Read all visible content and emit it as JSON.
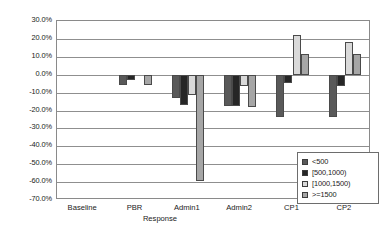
{
  "chart_data": {
    "type": "bar",
    "title": "",
    "xlabel": "Response",
    "ylabel": "",
    "ylim": [
      -70,
      30
    ],
    "grid": true,
    "legend_position": "inside-lower-right",
    "ytick_labels": [
      "30.0%",
      "20.0%",
      "10.0%",
      "0.0%",
      "-10.0%",
      "-20.0%",
      "-30.0%",
      "-40.0%",
      "-50.0%",
      "-60.0%",
      "-70.0%"
    ],
    "ytick_values": [
      30,
      20,
      10,
      0,
      -10,
      -20,
      -30,
      -40,
      -50,
      -60,
      -70
    ],
    "categories": [
      "Baseline",
      "PBR",
      "Admin1",
      "Admin2",
      "CP1",
      "CP2"
    ],
    "series": [
      {
        "name": "<500",
        "color": "#595959",
        "values": [
          0.0,
          -6.0,
          -13.0,
          -17.5,
          -23.5,
          -23.5
        ]
      },
      {
        "name": "[500,1000)",
        "color": "#262626",
        "values": [
          0.0,
          -3.0,
          -17.0,
          -17.5,
          -4.5,
          -6.5
        ]
      },
      {
        "name": "[1000,1500)",
        "color": "#d9d9d9",
        "values": [
          0.0,
          0.0,
          -11.5,
          -6.5,
          22.0,
          18.5
        ]
      },
      {
        "name": ">=1500",
        "color": "#a6a6a6",
        "values": [
          0.0,
          -5.5,
          -59.5,
          -18.0,
          11.5,
          11.5
        ]
      }
    ]
  },
  "legend": {
    "entries": [
      {
        "label": "<500"
      },
      {
        "label": "[500,1000)"
      },
      {
        "label": "[1000,1500)"
      },
      {
        "label": ">=1500"
      }
    ]
  },
  "colors": {
    "axis": "#8a8a8a",
    "gridline": "#8f8f8f",
    "bar_outline": "#4a4a4a",
    "text": "#1a1a1a",
    "background": "#ffffff"
  }
}
